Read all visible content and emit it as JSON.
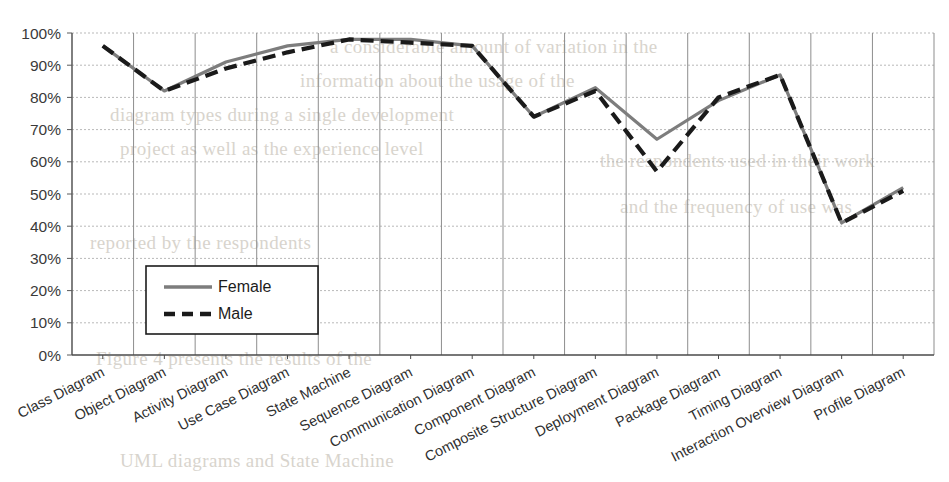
{
  "chart_data": {
    "type": "line",
    "title": "",
    "subtitle": "",
    "xlabel": "",
    "ylabel": "",
    "ylim": [
      0,
      100
    ],
    "ytick_labels": [
      "0%",
      "10%",
      "20%",
      "30%",
      "40%",
      "50%",
      "60%",
      "70%",
      "80%",
      "90%",
      "100%"
    ],
    "ytick_values": [
      0,
      10,
      20,
      30,
      40,
      50,
      60,
      70,
      80,
      90,
      100
    ],
    "grid": "horizontal-dotted-and-vertical-solid",
    "legend_position": "inside-lower-left",
    "categories": [
      "Class Diagram",
      "Object Diagram",
      "Activity Diagram",
      "Use Case Diagram",
      "State Machine",
      "Sequence Diagram",
      "Communication Diagram",
      "Component Diagram",
      "Composite Structure Diagram",
      "Deployment Diagram",
      "Package Diagram",
      "Timing Diagram",
      "Interaction Overview Diagram",
      "Profile Diagram"
    ],
    "series": [
      {
        "name": "Female",
        "color": "#7d7d7d",
        "style": "solid",
        "values": [
          96,
          82,
          91,
          96,
          98,
          98,
          96,
          74,
          83,
          67,
          79,
          87,
          41,
          52
        ]
      },
      {
        "name": "Male",
        "color": "#1a1a1a",
        "style": "dashed",
        "values": [
          96,
          82,
          89,
          94,
          98,
          97,
          96,
          74,
          82,
          57,
          80,
          87,
          41,
          51
        ]
      }
    ]
  },
  "legend": {
    "entries": [
      {
        "label": "Female"
      },
      {
        "label": "Male"
      }
    ]
  },
  "background_bleed": {
    "lines": [
      "a considerable amount of variation in the",
      "information about the usage of the",
      "diagram types during a single development",
      "project as well as the experience level",
      "the respondents used in their work",
      "and the frequency of use was",
      "reported by the respondents",
      "Figure 4 presents the results of the",
      "UML diagrams and State Machine"
    ]
  }
}
